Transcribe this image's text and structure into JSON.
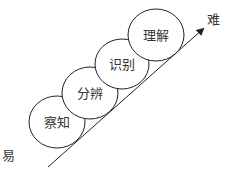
{
  "diagram": {
    "type": "staircase-progression",
    "stages": [
      {
        "label": "察知",
        "cx": 57,
        "cy": 122,
        "rx": 28,
        "ry": 26
      },
      {
        "label": "分辨",
        "cx": 90,
        "cy": 93,
        "rx": 28,
        "ry": 26
      },
      {
        "label": "识别",
        "cx": 122,
        "cy": 64,
        "rx": 27,
        "ry": 25
      },
      {
        "label": "理解",
        "cx": 156,
        "cy": 35,
        "rx": 28,
        "ry": 26
      }
    ],
    "axis": {
      "start_label": "易",
      "end_label": "难",
      "x1": 48,
      "y1": 167,
      "x2": 203,
      "y2": 29
    },
    "colors": {
      "stroke": "#222222",
      "text": "#333333",
      "background": "#ffffff"
    }
  }
}
